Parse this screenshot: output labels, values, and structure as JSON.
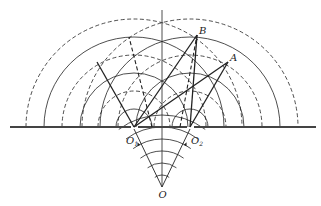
{
  "diagram": {
    "colors": {
      "line": "#222222",
      "barrier": "#444444",
      "background": "#ffffff"
    },
    "barrier": {
      "y": 127,
      "segments": [
        [
          10,
          131
        ],
        [
          138,
          187
        ],
        [
          194,
          316
        ]
      ]
    },
    "axis": {
      "x": 162,
      "y1": 10,
      "y2": 187
    },
    "source": {
      "label": "O",
      "x": 162,
      "y": 187
    },
    "slits": [
      {
        "label": "O",
        "subscript": "1",
        "x": 134,
        "y": 127
      },
      {
        "label": "O",
        "subscript": "2",
        "x": 190,
        "y": 127
      }
    ],
    "wavefront_radii": [
      18,
      36,
      54,
      72,
      90,
      108
    ],
    "wavefront_styles": [
      "solid",
      "dashed",
      "solid",
      "dashed",
      "solid",
      "dashed"
    ],
    "source_arcs": {
      "radii": [
        12,
        24,
        36,
        48,
        60
      ],
      "half_angle_deg": 30
    },
    "points": [
      {
        "label": "B",
        "x": 197,
        "y": 35
      },
      {
        "label": "A",
        "x": 228,
        "y": 62
      }
    ],
    "segments": [
      {
        "from": "O1",
        "to": "B",
        "style": "solid"
      },
      {
        "from": "O2",
        "to": "B",
        "style": "solid"
      },
      {
        "from": "O1",
        "to": "A",
        "style": "solid"
      },
      {
        "from": "O2",
        "to": "A",
        "style": "solid"
      },
      {
        "from": [
          134,
          127
        ],
        "to": [
          97,
          62
        ],
        "style": "solid"
      },
      {
        "from": [
          152,
          127
        ],
        "to": [
          129,
          37
        ],
        "style": "dashed"
      },
      {
        "from": [
          180,
          127
        ],
        "to": [
          197,
          35
        ],
        "style": "dashed"
      }
    ],
    "rays": [
      {
        "from": "O",
        "to": "O1"
      },
      {
        "from": "O",
        "to": "O2"
      }
    ]
  }
}
